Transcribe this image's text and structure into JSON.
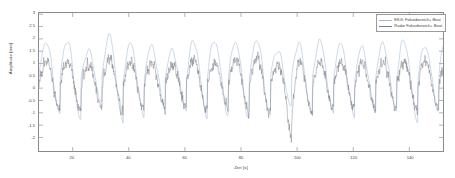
{
  "chart_data": {
    "type": "line",
    "title": "",
    "xlabel": "Zeit [s]",
    "ylabel": "Amplitude [mm]",
    "xlim": [
      8,
      152
    ],
    "ylim": [
      -2.55,
      3.05
    ],
    "xticks": [
      20,
      40,
      60,
      80,
      100,
      120,
      140
    ],
    "xtick_labels": [
      "20",
      "40",
      "60",
      "80",
      "100",
      "120",
      "140"
    ],
    "yticks": [
      3,
      2.5,
      2,
      1.5,
      1,
      0.5,
      0,
      -0.5,
      -1,
      -1.5,
      -2
    ],
    "ytick_labels": [
      "3",
      "2.5",
      "2",
      "1.5",
      "1",
      "0.5",
      "0",
      "-0.5",
      "-1",
      "-1.5",
      "-2"
    ],
    "grid": false,
    "legend_position": "top-right",
    "series": [
      {
        "name": "EKG: Fokusbereich+ Beat",
        "color": "#9fb8d8",
        "style": "smooth",
        "amplitude_range": [
          -1.3,
          2.1
        ],
        "period_s": 7.5,
        "description": "Glatte quasi-periodische Referenzkurve mit hoeherer Amplitude"
      },
      {
        "name": "Radar Fokusbereich+ Beat",
        "color": "#7d7d88",
        "style": "noisy",
        "amplitude_range": [
          -2.35,
          1.85
        ],
        "period_s": 7.5,
        "description": "Verrauschte Radar-Messkurve mit hochfrequenten Anteilen"
      }
    ],
    "n_cycles": 19,
    "notable_features": [
      {
        "x": 98,
        "y": -2.35,
        "label": "tiefster Einbruch der Radarkurve"
      }
    ]
  },
  "axes": {
    "frame_color": "#8a8a8a",
    "tick_color": "#666666",
    "background": "#ffffff"
  },
  "legend": {
    "entries": [
      {
        "label": "EKG: Fokusbereich+ Beat",
        "color": "#9fb8d8"
      },
      {
        "label": "Radar Fokusbereich+ Beat",
        "color": "#7d7d88"
      }
    ]
  }
}
